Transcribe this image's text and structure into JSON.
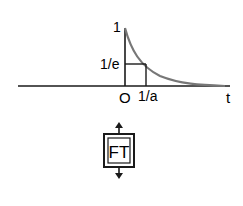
{
  "diagram": {
    "labels": {
      "y_max": "1",
      "y_mark": "1/e",
      "origin": "O",
      "x_mark": "1/a",
      "x_axis": "t"
    },
    "box_label": "FT",
    "colors": {
      "line": "#1a1a1a",
      "curve": "#777777"
    }
  }
}
